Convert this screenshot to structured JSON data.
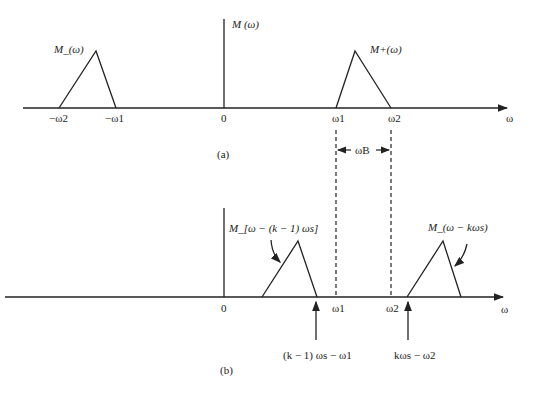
{
  "figure": {
    "panel_a": {
      "caption": "(a)",
      "y_axis_label": "M (ω)",
      "x_axis_label": "ω",
      "origin_label": "0",
      "neg_spectrum_label": "M_(ω)",
      "pos_spectrum_label": "M+(ω)",
      "ticks": {
        "neg_w2": "−ω2",
        "neg_w1": "−ω1",
        "w1": "ω1",
        "w2": "ω2"
      },
      "bandwidth_label": "ωB"
    },
    "panel_b": {
      "caption": "(b)",
      "x_axis_label": "ω",
      "origin_label": "0",
      "left_spectrum_label": "M_[ω − (k − 1) ωs]",
      "right_spectrum_label": "M_(ω − kωs)",
      "ticks": {
        "w1": "ω1",
        "w2": "ω2"
      },
      "left_edge_label": "(k − 1) ωs − ω1",
      "right_edge_label": "kωs − ω2"
    }
  }
}
